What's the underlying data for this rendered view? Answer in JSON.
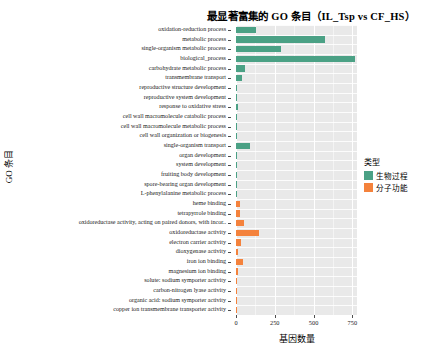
{
  "chart_data": {
    "type": "bar",
    "title": "最显著富集的 GO 条目（IL_Tsp vs CF_HS）",
    "xlabel": "基因数量",
    "ylabel": "GO 条目",
    "orientation": "horizontal",
    "xlim": [
      0,
      780
    ],
    "xticks": [
      0,
      250,
      500,
      750
    ],
    "xticklabels": [
      "0",
      "250",
      "500",
      "750"
    ],
    "grid": true,
    "legend_position": "right",
    "colors": {
      "biological_process": "#4BA185",
      "molecular_function": "#F4823C",
      "panel_background": "#E9E9E9",
      "gridline": "#FFFFFF"
    },
    "legend": {
      "title": "类型",
      "entries": [
        {
          "label": "生物过程",
          "color": "#4BA185",
          "key": "biological_process"
        },
        {
          "label": "分子功能",
          "color": "#F4823C",
          "key": "molecular_function"
        }
      ]
    },
    "categories": [
      "oxidation-reduction process",
      "metabolic process",
      "single-organism metabolic process",
      "biological_process",
      "carbohydrate metabolic process",
      "transmembrane transport",
      "reproductive structure development",
      "reproductive system development",
      "response to oxidative stress",
      "cell wall macromolecule catabolic process",
      "cell wall macromolecule metabolic process",
      "cell wall organization or biogenesis",
      "single-organism transport",
      "organ development",
      "system development",
      "fruiting body development",
      "spore-bearing organ development",
      "L-phenylalanine metabolic process",
      "heme binding",
      "tetrapyrrole binding",
      "oxidoreductase activity, acting on paired donors, with incor..",
      "oxidoreductase activity",
      "electron carrier activity",
      "dioxygenase activity",
      "iron ion binding",
      "magnesium ion binding",
      "solute: sodium symporter activity",
      "carbon-nitrogen lyase activity",
      "organic acid: sodium symporter activity",
      "copper ion transmembrane transporter activity"
    ],
    "values": [
      132,
      572,
      287,
      766,
      56,
      40,
      4,
      4,
      10,
      4,
      4,
      7,
      88,
      4,
      4,
      4,
      4,
      4,
      26,
      27,
      49,
      149,
      33,
      12,
      42,
      11,
      4,
      3,
      3,
      3
    ],
    "groups": [
      "biological_process",
      "biological_process",
      "biological_process",
      "biological_process",
      "biological_process",
      "biological_process",
      "biological_process",
      "biological_process",
      "biological_process",
      "biological_process",
      "biological_process",
      "biological_process",
      "biological_process",
      "biological_process",
      "biological_process",
      "biological_process",
      "biological_process",
      "biological_process",
      "molecular_function",
      "molecular_function",
      "molecular_function",
      "molecular_function",
      "molecular_function",
      "molecular_function",
      "molecular_function",
      "molecular_function",
      "molecular_function",
      "molecular_function",
      "molecular_function",
      "molecular_function"
    ]
  }
}
